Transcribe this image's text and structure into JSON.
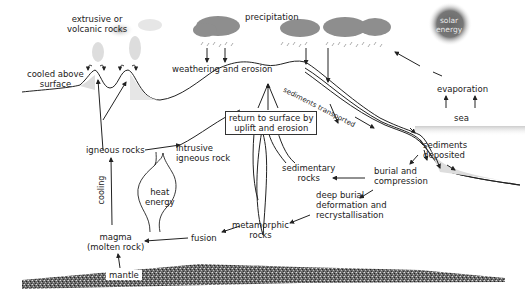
{
  "diagram": {
    "type": "rock-cycle",
    "colors": {
      "line": "#222222",
      "cloud": "#8a8a8a",
      "sun": "#6a6a6a",
      "mantle": "#555555",
      "sea": "#d8d8d8",
      "background": "#ffffff"
    },
    "labels": {
      "extrusive": "extrusive or",
      "extrusive2": "volcanic rocks",
      "cooled": "cooled above",
      "cooled2": "surface",
      "precipitation": "precipitation",
      "solar": "solar",
      "solar2": "energy",
      "weathering": "weathering and erosion",
      "sediments_transported": "sediments transported",
      "evaporation": "evaporation",
      "sea": "sea",
      "return_surface": "return to surface by",
      "return_surface2": "uplift and erosion",
      "igneous_rocks": "igneous rocks",
      "intrusive": "intrusive",
      "intrusive2": "igneous rock",
      "sediments_deposited": "sediments",
      "sediments_deposited2": "deposited",
      "sedimentary_rocks": "sedimentary",
      "sedimentary_rocks2": "rocks",
      "burial": "burial and",
      "burial2": "compression",
      "deep_burial": "deep burial",
      "deep_burial2": "deformation and",
      "deep_burial3": "recrystallisation",
      "heat_energy": "heat",
      "heat_energy2": "energy",
      "cooling": "cooling",
      "metamorphic": "metamorphic",
      "metamorphic2": "rocks",
      "magma": "magma",
      "magma2": "(molten rock)",
      "fusion": "fusion",
      "mantle": "mantle"
    }
  }
}
